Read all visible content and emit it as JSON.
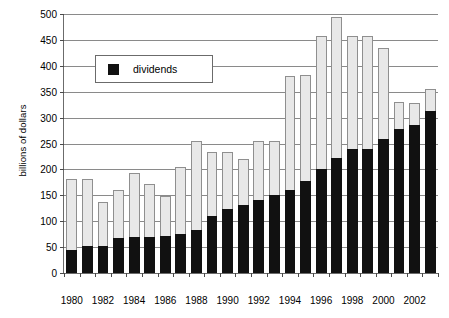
{
  "chart_data": {
    "type": "bar",
    "subtype": "stacked",
    "title": "",
    "xlabel": "",
    "ylabel": "billions of dollars",
    "ylim": [
      0,
      500
    ],
    "ytick_values": [
      0,
      50,
      100,
      150,
      200,
      250,
      300,
      350,
      400,
      450,
      500
    ],
    "ytick_labels": [
      "0",
      "50",
      "100",
      "150",
      "200",
      "250",
      "300",
      "350",
      "400",
      "450",
      "500"
    ],
    "grid": true,
    "legend_position": "upper-left-inside",
    "categories": [
      1980,
      1981,
      1982,
      1983,
      1984,
      1985,
      1986,
      1987,
      1988,
      1989,
      1990,
      1991,
      1992,
      1993,
      1994,
      1995,
      1996,
      1997,
      1998,
      1999,
      2000,
      2001,
      2002,
      2003
    ],
    "xtick_labels": [
      "1980",
      "1982",
      "1984",
      "1986",
      "1988",
      "1990",
      "1992",
      "1994",
      "1996",
      "1998",
      "2000",
      "2002"
    ],
    "xtick_values": [
      1980,
      1982,
      1984,
      1986,
      1988,
      1990,
      1992,
      1994,
      1996,
      1998,
      2000,
      2002
    ],
    "series": [
      {
        "name": "dividends",
        "color": "#111111",
        "values": [
          45,
          53,
          53,
          67,
          70,
          70,
          72,
          76,
          83,
          110,
          123,
          132,
          140,
          150,
          160,
          178,
          200,
          222,
          240,
          240,
          258,
          278,
          285,
          312
        ]
      },
      {
        "name": "other",
        "color": "#e8e8e8",
        "values": [
          137,
          129,
          84,
          93,
          124,
          101,
          76,
          129,
          172,
          123,
          110,
          88,
          115,
          105,
          220,
          205,
          258,
          273,
          218,
          218,
          177,
          52,
          43,
          43
        ]
      }
    ],
    "totals": [
      182,
      182,
      137,
      160,
      194,
      171,
      148,
      205,
      255,
      233,
      233,
      220,
      255,
      255,
      380,
      383,
      458,
      495,
      458,
      458,
      435,
      330,
      328,
      355
    ]
  },
  "legend": {
    "entries": [
      {
        "label": "dividends",
        "swatch_name": "dividends-swatch"
      }
    ]
  }
}
